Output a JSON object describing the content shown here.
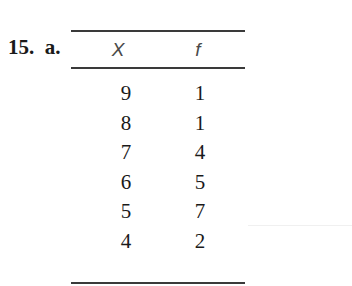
{
  "problem": {
    "label": "15.  a."
  },
  "table": {
    "headers": {
      "x": "X",
      "f": "f"
    },
    "rows": [
      {
        "x": "9",
        "f": "1"
      },
      {
        "x": "8",
        "f": "1"
      },
      {
        "x": "7",
        "f": "4"
      },
      {
        "x": "6",
        "f": "5"
      },
      {
        "x": "5",
        "f": "7"
      },
      {
        "x": "4",
        "f": "2"
      }
    ]
  }
}
